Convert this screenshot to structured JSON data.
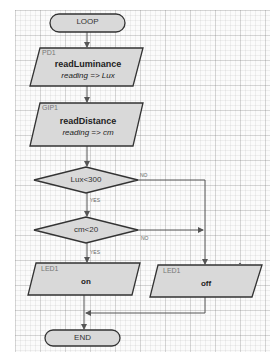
{
  "caption": "",
  "colors": {
    "shape_fill": "#d9d9d9",
    "shape_stroke": "#333333",
    "line": "#555555",
    "grid_bg": "#fbfbfb"
  },
  "flowchart": {
    "start": {
      "label": "LOOP"
    },
    "steps": [
      {
        "id": "pd1",
        "tag": "PD1",
        "function": "readLuminance",
        "assignment": "reading => Lux"
      },
      {
        "id": "gip1",
        "tag": "GIP1",
        "function": "readDistance",
        "assignment": "reading => cm"
      }
    ],
    "decisions": [
      {
        "id": "d1",
        "condition": "Lux<300",
        "yes_label": "YES",
        "no_label": "NO"
      },
      {
        "id": "d2",
        "condition": "cm<20",
        "yes_label": "YES",
        "no_label": "NO"
      }
    ],
    "outputs": [
      {
        "id": "led_on",
        "tag": "LED1",
        "value": "on"
      },
      {
        "id": "led_off",
        "tag": "LED1",
        "value": "off"
      }
    ],
    "end": {
      "label": "END"
    }
  }
}
